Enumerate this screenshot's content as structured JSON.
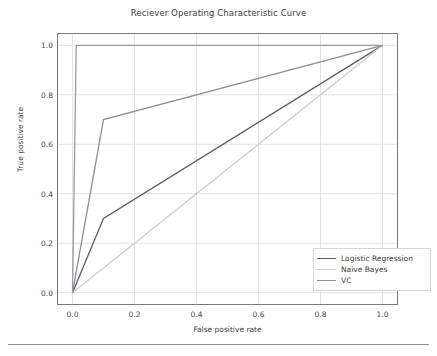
{
  "chart_data": {
    "type": "line",
    "title": "Reciever Operating Characteristic Curve",
    "xlabel": "False positive rate",
    "ylabel": "True positive rate",
    "xlim": [
      -0.05,
      1.05
    ],
    "ylim": [
      -0.05,
      1.05
    ],
    "xticks": [
      "0.0",
      "0.2",
      "0.4",
      "0.6",
      "0.8",
      "1.0"
    ],
    "xtick_values": [
      0.0,
      0.2,
      0.4,
      0.6,
      0.8,
      1.0
    ],
    "yticks": [
      "0.0",
      "0.2",
      "0.4",
      "0.6",
      "0.8",
      "1.0"
    ],
    "ytick_values": [
      0.0,
      0.2,
      0.4,
      0.6,
      0.8,
      1.0
    ],
    "grid": true,
    "legend_position": "lower right",
    "series": [
      {
        "name": "Logistic Regression",
        "color": "#555f6e",
        "x": [
          0.0,
          0.1,
          1.0
        ],
        "y": [
          0.0,
          0.3,
          1.0
        ]
      },
      {
        "name": "Naive Bayes",
        "color": "#cfcfc4",
        "x": [
          0.0,
          1.0
        ],
        "y": [
          0.0,
          1.0
        ]
      },
      {
        "name": "VC",
        "color": "#8a8f99",
        "x": [
          0.0,
          0.1,
          1.0
        ],
        "y": [
          0.0,
          0.7,
          1.0
        ]
      },
      {
        "name": "perfect-step",
        "color": "#9a9a9a",
        "x": [
          0.0,
          0.012,
          1.0
        ],
        "y": [
          0.0,
          1.0,
          1.0
        ]
      }
    ]
  },
  "legend": {
    "items": [
      {
        "label": "Logistic Regression",
        "color": "#555f6e"
      },
      {
        "label": "Naive Bayes",
        "color": "#cfcfc4"
      },
      {
        "label": "VC",
        "color": "#8a8f99"
      }
    ]
  },
  "colors": {
    "axis": "#7a7a7a",
    "grid": "#e3e3e3",
    "text": "#3c3c3c",
    "background": "#ffffff"
  }
}
